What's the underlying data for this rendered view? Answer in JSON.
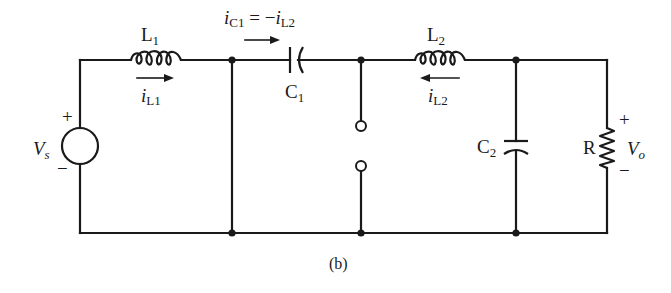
{
  "figure": {
    "caption": "(b)",
    "components": {
      "source": {
        "name": "V",
        "subscript": "s",
        "plus": "+",
        "minus": "−"
      },
      "L1": {
        "name": "L",
        "subscript": "1",
        "current_name": "i",
        "current_sub": "L1",
        "current_direction": "right"
      },
      "C1": {
        "name": "C",
        "subscript": "1",
        "current_label_main": "i",
        "current_label_sub1": "C1",
        "current_label_eq": " = −",
        "current_label_i2": "i",
        "current_label_sub2": "L2",
        "current_direction": "right"
      },
      "switch": {
        "name": "switch",
        "state": "open"
      },
      "L2": {
        "name": "L",
        "subscript": "2",
        "current_name": "i",
        "current_sub": "L2",
        "current_direction": "left"
      },
      "C2": {
        "name": "C",
        "subscript": "2"
      },
      "R": {
        "name": "R"
      },
      "output": {
        "name": "V",
        "subscript": "o",
        "plus": "+",
        "minus": "−"
      }
    }
  }
}
